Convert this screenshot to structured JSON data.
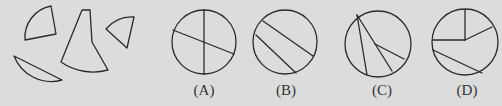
{
  "colors": {
    "background": "#dcdcdc",
    "stroke": "#2a2a2a",
    "text": "#333333"
  },
  "pieces": [
    {
      "name": "quarter-sector-piece",
      "description": "sector wedge, top-left"
    },
    {
      "name": "tall-sector-piece",
      "description": "tall narrow sector with truncated top, center"
    },
    {
      "name": "small-sector-piece",
      "description": "small sector wedge, right"
    },
    {
      "name": "circular-segment-piece",
      "description": "circular segment, bottom-left"
    }
  ],
  "options": [
    {
      "id": "A",
      "label": "(A)",
      "description": "circle divided by a vertical diameter and a slanted diameter"
    },
    {
      "id": "B",
      "label": "(B)",
      "description": "circle divided by two parallel slanted chords"
    },
    {
      "id": "C",
      "label": "(C)",
      "description": "circle with chords fanning from a point on the top-left of the circumference, one branch to an interior point"
    },
    {
      "id": "D",
      "label": "(D)",
      "description": "circle with radii from center (up, left, upper-right) and a slanted chord across the bottom"
    }
  ]
}
